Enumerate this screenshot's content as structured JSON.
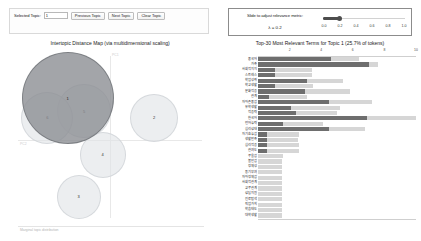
{
  "toolbar": {
    "selected_topic_label": "Selected Topic:",
    "selected_topic_value": "1",
    "previous_topic_label": "Previous Topic",
    "next_topic_label": "Next Topic",
    "clear_topic_label": "Clear Topic"
  },
  "lambda_panel": {
    "caption": "Slide to adjust relevance metric:",
    "superscript": "(2)",
    "value_text": "λ = 0.2",
    "lambda_value": 0.2,
    "ticks": [
      "0.0",
      "0.2",
      "0.4",
      "0.6",
      "0.8",
      "1.0"
    ]
  },
  "left_panel": {
    "title": "Intertopic Distance Map (via multidimensional scaling)",
    "axis_x_label": "PC1",
    "axis_y_label": "PC2",
    "legend_caption": "Marginal topic distribution"
  },
  "right_panel": {
    "title": "Top-30 Most Relevant Terms for Topic 1 (25.7% of tokens)",
    "topic_number": 1,
    "token_percent": "25.7%"
  },
  "chart_data": [
    {
      "type": "scatter",
      "title": "Intertopic Distance Map (via multidimensional scaling)",
      "xlabel": "PC1",
      "ylabel": "PC2",
      "grid": false,
      "legend": "Marginal topic distribution",
      "points": [
        {
          "label": "1",
          "x": 0.27,
          "y": 0.74,
          "size": 46,
          "selected": true
        },
        {
          "label": "5",
          "x": 0.36,
          "y": 0.66,
          "size": 27,
          "selected": false
        },
        {
          "label": "6",
          "x": 0.16,
          "y": 0.62,
          "size": 26,
          "selected": false
        },
        {
          "label": "2",
          "x": 0.74,
          "y": 0.62,
          "size": 24,
          "selected": false
        },
        {
          "label": "4",
          "x": 0.46,
          "y": 0.39,
          "size": 23,
          "selected": false
        },
        {
          "label": "3",
          "x": 0.33,
          "y": 0.13,
          "size": 22,
          "selected": false
        }
      ]
    },
    {
      "type": "bar",
      "orientation": "horizontal",
      "title": "Top-30 Most Relevant Terms for Topic 1 (25.7% of tokens)",
      "xlabel": "",
      "ylabel": "",
      "xlim": [
        0,
        10
      ],
      "xticks": [
        "2",
        "4",
        "6",
        "8",
        "10"
      ],
      "grid": false,
      "series": [
        {
          "name": "Overall term frequency",
          "color": "#d6d6d6"
        },
        {
          "name": "Estimated term frequency within the selected topic",
          "color": "#6e6e6e"
        }
      ],
      "categories": [
        "중국어",
        "가족",
        "사회적지지",
        "스트레스",
        "학업성취",
        "학교생활",
        "문화적응",
        "관계",
        "자아존중감",
        "유학생활",
        "적응력",
        "한국어",
        "언어능력",
        "심리상태",
        "자기효능감",
        "생활만족",
        "심리적응",
        "관여도",
        "우울감",
        "불안감",
        "정체성",
        "동기부여",
        "자아정체감",
        "사회적관계",
        "교우관계",
        "상담지원",
        "진로탐색",
        "직업가치",
        "학습태도",
        "대학생활"
      ],
      "overall_values": [
        6.4,
        7.6,
        3.4,
        3.4,
        5.4,
        3.5,
        5.8,
        3.1,
        7.2,
        5.2,
        5.0,
        10.0,
        4.1,
        6.8,
        2.6,
        2.5,
        2.6,
        2.6,
        1.6,
        1.5,
        1.5,
        1.5,
        1.5,
        1.5,
        1.5,
        1.5,
        1.5,
        1.5,
        1.5,
        1.5
      ],
      "topic_values": [
        4.6,
        7.0,
        1.1,
        1.1,
        3.1,
        1.1,
        3.0,
        0.7,
        4.5,
        2.1,
        2.4,
        6.9,
        1.6,
        4.5,
        0.6,
        0.6,
        0.6,
        0.6,
        0.0,
        0.0,
        0.0,
        0.0,
        0.0,
        0.0,
        0.0,
        0.0,
        0.0,
        0.0,
        0.0,
        0.0
      ]
    }
  ]
}
